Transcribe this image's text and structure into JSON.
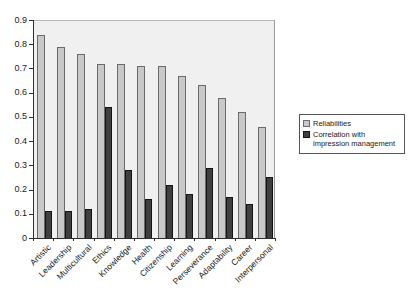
{
  "chart_data": {
    "type": "bar",
    "title": "",
    "xlabel": "",
    "ylabel": "",
    "categories": [
      "Artistic",
      "Leadership",
      "Multicultural",
      "Ethics",
      "Knowledge",
      "Health",
      "Citizenship",
      "Learning",
      "Perseverance",
      "Adaptability",
      "Career",
      "Interpersonal"
    ],
    "series": [
      {
        "name": "Reliabilities",
        "color": "#c8c8c8",
        "border_color": "#6b6b6b",
        "values": [
          0.84,
          0.79,
          0.76,
          0.72,
          0.72,
          0.71,
          0.71,
          0.67,
          0.63,
          0.58,
          0.52,
          0.46
        ]
      },
      {
        "name": "Correlation with impression management",
        "color": "#3f3f3f",
        "border_color": "#141414",
        "values": [
          0.11,
          0.11,
          0.12,
          0.54,
          0.28,
          0.16,
          0.22,
          0.18,
          0.29,
          0.17,
          0.14,
          0.25
        ]
      }
    ],
    "ylim": [
      0,
      0.9
    ],
    "ytick_labels": [
      "0.9",
      "0.8",
      "0.7",
      "0.6",
      "0.5",
      "0.4",
      "0.3",
      "0.2",
      "0.1",
      "0"
    ],
    "grid": false,
    "legend_position": "right"
  },
  "colors": {
    "plot_bg": "#f0f0f0",
    "axis": "#2e2e2e",
    "page_bg": "#ffffff"
  }
}
